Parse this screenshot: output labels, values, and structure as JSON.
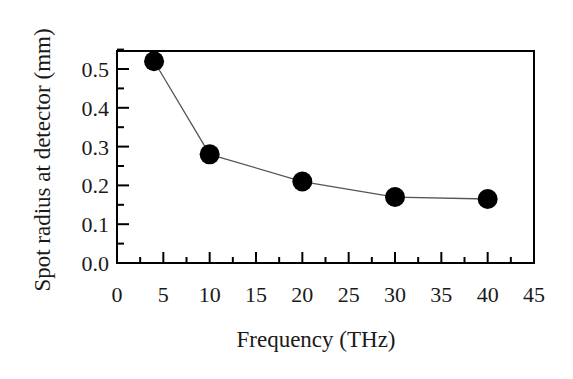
{
  "chart_data": {
    "type": "line",
    "title": "",
    "xlabel": "Frequency (THz)",
    "ylabel": "Spot radius at detector (mm)",
    "xlim": [
      0,
      45
    ],
    "ylim": [
      0.0,
      0.55
    ],
    "x_ticks": [
      0,
      5,
      10,
      15,
      20,
      25,
      30,
      35,
      40,
      45
    ],
    "x_tick_labels": [
      "0",
      "5",
      "10",
      "15",
      "20",
      "25",
      "30",
      "35",
      "40",
      "45"
    ],
    "y_ticks": [
      0.0,
      0.1,
      0.2,
      0.3,
      0.4,
      0.5
    ],
    "y_tick_labels": [
      "0.0",
      "0.1",
      "0.2",
      "0.3",
      "0.4",
      "0.5"
    ],
    "grid": false,
    "legend": null,
    "series": [
      {
        "name": "Spot radius",
        "marker": "filled-circle",
        "line": "thin-gray",
        "x": [
          4,
          10,
          20,
          30,
          40
        ],
        "y": [
          0.52,
          0.28,
          0.21,
          0.17,
          0.165
        ]
      }
    ],
    "colors": {
      "marker": "#000000",
      "line": "#555555",
      "axis": "#000000"
    }
  }
}
